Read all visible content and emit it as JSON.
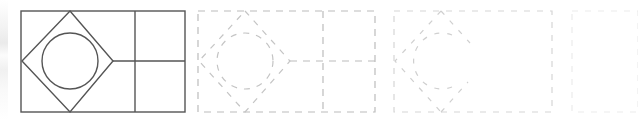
{
  "figure": {
    "canvas": {
      "width": 638,
      "height": 120,
      "background": "#ffffff"
    },
    "stroke_colors": {
      "solid": "#555555",
      "dashed_strong": "#b9b9b9",
      "dashed_faint": "#d6d6d6",
      "dashed_very_faint": "#e4e4e4",
      "dashed_ghost": "#ededed"
    },
    "panels": [
      {
        "index": 1,
        "name": "panel-solid",
        "label": "Complete figure",
        "style": "solid",
        "stroke": "#555555",
        "stroke_width": 1.4,
        "dash": "none",
        "opacity": 1,
        "frame": {
          "x": 21,
          "y": 11,
          "width": 164,
          "height": 101
        },
        "shapes": {
          "outer_rect": true,
          "vertical_divider": true,
          "horizontal_divider": true,
          "diamond": true,
          "circle": true
        },
        "vertical_divider_x": 135,
        "horizontal_divider_y": 61,
        "horizontal_divider_x_start": 113,
        "diamond_vertices": [
          [
            70,
            11
          ],
          [
            113,
            61
          ],
          [
            70,
            112
          ],
          [
            22,
            61
          ]
        ],
        "circle": {
          "cx": 70,
          "cy": 61,
          "r": 28
        }
      },
      {
        "index": 2,
        "name": "panel-dashed-full",
        "label": "Dashed full figure",
        "style": "dashed",
        "stroke": "#b9b9b9",
        "stroke_width": 1.2,
        "dash": "7 6",
        "opacity": 1,
        "frame": {
          "x": 198,
          "y": 11,
          "width": 177,
          "height": 101
        },
        "shapes": {
          "outer_rect": true,
          "vertical_divider": true,
          "horizontal_divider": true,
          "diamond": true,
          "circle": true
        },
        "vertical_divider_x": 323,
        "horizontal_divider_y": 61,
        "horizontal_divider_x_start": 290,
        "diamond_vertices": [
          [
            245,
            11
          ],
          [
            290,
            61
          ],
          [
            245,
            112
          ],
          [
            199,
            61
          ]
        ],
        "circle": {
          "cx": 245,
          "cy": 61,
          "r": 28
        }
      },
      {
        "index": 3,
        "name": "panel-dashed-partial",
        "label": "Partially erased figure",
        "style": "dashed",
        "stroke": "#d6d6d6",
        "stroke_width": 1.2,
        "dash": "6 7",
        "opacity": 1,
        "frame": {
          "x": 394,
          "y": 11,
          "width": 158,
          "height": 101
        },
        "shapes": {
          "outer_rect": true,
          "vertical_divider": false,
          "horizontal_divider": false,
          "diamond": "left-half-only",
          "circle": "left-arc-only"
        },
        "diamond_vertices": [
          [
            441,
            11
          ],
          [
            486,
            61
          ],
          [
            441,
            112
          ],
          [
            395,
            61
          ]
        ],
        "circle": {
          "cx": 441,
          "cy": 61,
          "r": 28
        }
      },
      {
        "index": 4,
        "name": "panel-empty-frame",
        "label": "Empty frame",
        "style": "dashed",
        "stroke": "#ededed",
        "stroke_width": 1.2,
        "dash": "6 7",
        "opacity": 1,
        "frame": {
          "x": 572,
          "y": 11,
          "width": 66,
          "height": 101
        },
        "shapes": {
          "outer_rect": true,
          "vertical_divider": false,
          "horizontal_divider": false,
          "diamond": false,
          "circle": false
        }
      }
    ],
    "left_edge_artifact": {
      "name": "left-edge-artifact",
      "present": true,
      "x": 0,
      "width": 8,
      "color": "#ededed"
    }
  }
}
